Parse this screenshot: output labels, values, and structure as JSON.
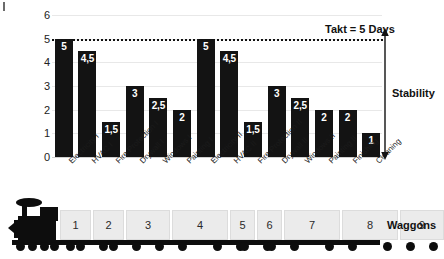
{
  "chart_data": {
    "type": "bar",
    "title": "",
    "xlabel": "",
    "ylabel": "",
    "ylim": [
      0,
      6
    ],
    "yticks": [
      "0",
      "1",
      "2",
      "3",
      "4",
      "5",
      "6"
    ],
    "grid": true,
    "legend": "none",
    "categories": [
      "Electricity I",
      "HVAC I",
      "Fire Protection I",
      "Drywall I",
      "Windows I",
      "Painting I",
      "Electricity II",
      "HVAC II",
      "Fire Protection II",
      "Drywall II",
      "Windows II",
      "Painting II",
      "Finishing",
      "Cleaning"
    ],
    "values": [
      5,
      4.5,
      1.5,
      3,
      2.5,
      2,
      5,
      4.5,
      1.5,
      3,
      2.5,
      2,
      2,
      1
    ],
    "value_labels": [
      "5",
      "4,5",
      "1,5",
      "3",
      "2,5",
      "2",
      "5",
      "4,5",
      "1,5",
      "3",
      "2,5",
      "2",
      "2",
      "1"
    ],
    "bar_color": "#131313",
    "value_label_color": "#ffffff",
    "annotations": [
      {
        "name": "takt-line",
        "label": "Takt = 5 Days",
        "y": 5,
        "style": "dotted"
      },
      {
        "name": "stability-arrow",
        "label": "Stability",
        "from_y": 0,
        "to_y": 5,
        "style": "double-headed-arrow"
      }
    ]
  },
  "train": {
    "label": "Waggons",
    "waggons": [
      {
        "number": "1",
        "width": 31
      },
      {
        "number": "2",
        "width": 31
      },
      {
        "number": "3",
        "width": 44
      },
      {
        "number": "4",
        "width": 56
      },
      {
        "number": "5",
        "width": 25
      },
      {
        "number": "6",
        "width": 25
      },
      {
        "number": "7",
        "width": 56
      },
      {
        "number": "8",
        "width": 56
      },
      {
        "number": "9",
        "width": 44
      }
    ]
  }
}
